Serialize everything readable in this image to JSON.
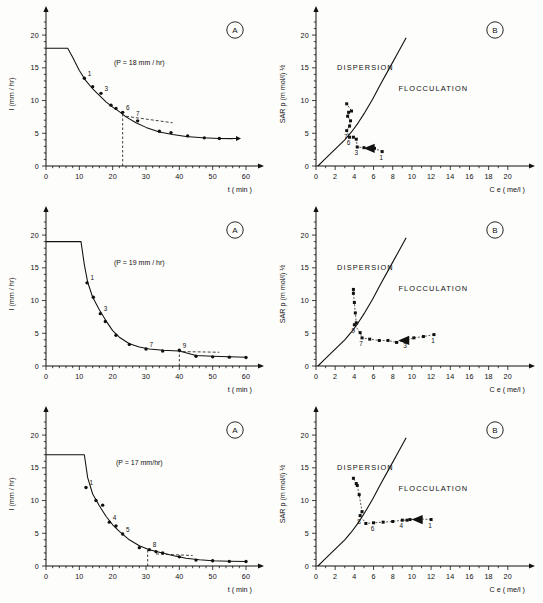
{
  "figure": {
    "panel_badge_a": "A",
    "panel_badge_b": "B",
    "caption": ""
  },
  "axes": {
    "left_ylabel": "I  (mm / hr)",
    "left_xlabel": "t ( min )",
    "right_ylabel": "SAR p  (m mol/l) ½",
    "right_xlabel": "C e ( me/l )",
    "left_yticks": [
      "0",
      "5",
      "10",
      "15",
      "20"
    ],
    "left_xticks": [
      "0",
      "10",
      "20",
      "30",
      "40",
      "50",
      "60"
    ],
    "right_yticks": [
      "0",
      "5",
      "10",
      "15",
      "20"
    ],
    "right_xticks": [
      "0",
      "2",
      "4",
      "6",
      "8",
      "10",
      "12",
      "14",
      "16",
      "18",
      "20"
    ]
  },
  "regions": {
    "dispersion": "DISPERSION",
    "flocculation": "FLOCCULATION"
  },
  "chart_data": [
    {
      "id": "row1-A",
      "type": "line",
      "title": "(P = 18 mm / hr)",
      "xlabel": "t ( min )",
      "ylabel": "I  (mm / hr)",
      "xlim": [
        0,
        63
      ],
      "ylim": [
        0,
        22
      ],
      "xticks": [
        0,
        10,
        20,
        30,
        40,
        50,
        60
      ],
      "yticks": [
        0,
        5,
        10,
        15,
        20
      ],
      "grid": false,
      "plateau": {
        "y": 18.0,
        "x_start": 0,
        "x_end": 6.5
      },
      "curve": [
        [
          6.5,
          18.0
        ],
        [
          8,
          16.6
        ],
        [
          10,
          14.6
        ],
        [
          12,
          13.0
        ],
        [
          14,
          11.8
        ],
        [
          16,
          10.8
        ],
        [
          18,
          9.8
        ],
        [
          20,
          9.0
        ],
        [
          22,
          8.3
        ],
        [
          24,
          7.5
        ],
        [
          27,
          6.6
        ],
        [
          30,
          5.9
        ],
        [
          34,
          5.2
        ],
        [
          38,
          4.8
        ],
        [
          42,
          4.5
        ],
        [
          47,
          4.3
        ],
        [
          52,
          4.2
        ],
        [
          56,
          4.15
        ]
      ],
      "points": [
        {
          "x": 11.5,
          "y": 13.4,
          "label": "1"
        },
        {
          "x": 14.0,
          "y": 12.1,
          "label": ""
        },
        {
          "x": 16.5,
          "y": 11.1,
          "label": "3"
        },
        {
          "x": 19.5,
          "y": 9.3,
          "label": ""
        },
        {
          "x": 21.0,
          "y": 8.8,
          "label": ""
        },
        {
          "x": 23.0,
          "y": 8.2,
          "label": "6"
        },
        {
          "x": 27.5,
          "y": 6.9,
          "label": ""
        },
        {
          "x": 34.0,
          "y": 5.3,
          "label": ""
        },
        {
          "x": 37.5,
          "y": 5.1,
          "label": ""
        },
        {
          "x": 42.5,
          "y": 4.6,
          "label": ""
        },
        {
          "x": 47.5,
          "y": 4.3,
          "label": ""
        },
        {
          "x": 52.0,
          "y": 4.2,
          "label": ""
        }
      ],
      "marker_label_7": {
        "x": 27.0,
        "y": 7.6,
        "label": "7"
      },
      "dashed_vertical_x": 23.0,
      "dashed_tangent": [
        [
          24.0,
          7.6
        ],
        [
          38.0,
          6.6
        ]
      ],
      "end_arrow": {
        "x0": 52,
        "y0": 4.2,
        "x1": 57,
        "y1": 4.2
      }
    },
    {
      "id": "row1-B",
      "type": "scatter",
      "xlabel": "C e ( me/l )",
      "ylabel": "SAR p  (m mol/l) ½",
      "xlim": [
        0,
        22
      ],
      "ylim": [
        0,
        22
      ],
      "xticks": [
        0,
        2,
        4,
        6,
        8,
        10,
        12,
        14,
        16,
        18,
        20
      ],
      "yticks": [
        0,
        5,
        10,
        15,
        20
      ],
      "grid": false,
      "threshold_curve": [
        [
          0.2,
          0.0
        ],
        [
          0.9,
          1.0
        ],
        [
          1.6,
          2.0
        ],
        [
          2.3,
          3.0
        ],
        [
          3.0,
          4.0
        ],
        [
          3.7,
          5.2
        ],
        [
          4.4,
          6.6
        ],
        [
          5.1,
          8.2
        ],
        [
          5.9,
          10.2
        ],
        [
          6.7,
          12.4
        ],
        [
          7.6,
          14.8
        ],
        [
          8.5,
          17.2
        ],
        [
          9.4,
          19.6
        ]
      ],
      "path_points": [
        {
          "x": 6.9,
          "y": 2.2,
          "label": "1"
        },
        {
          "x": 6.1,
          "y": 2.7,
          "label": ""
        },
        {
          "x": 5.6,
          "y": 2.7,
          "label": ""
        },
        {
          "x": 5.0,
          "y": 2.8,
          "label": ""
        },
        {
          "x": 4.3,
          "y": 2.9,
          "label": "3"
        },
        {
          "x": 4.2,
          "y": 4.1,
          "label": ""
        },
        {
          "x": 3.9,
          "y": 4.4,
          "label": ""
        },
        {
          "x": 3.5,
          "y": 4.4,
          "label": "6"
        },
        {
          "x": 3.2,
          "y": 5.4,
          "label": "7"
        },
        {
          "x": 3.5,
          "y": 6.1,
          "label": ""
        },
        {
          "x": 3.6,
          "y": 6.9,
          "label": ""
        },
        {
          "x": 3.3,
          "y": 7.6,
          "label": ""
        },
        {
          "x": 3.4,
          "y": 8.2,
          "label": ""
        },
        {
          "x": 3.7,
          "y": 8.4,
          "label": ""
        },
        {
          "x": 3.2,
          "y": 9.5,
          "label": ""
        }
      ],
      "arrow_marker": {
        "x": 5.6,
        "y": 2.7,
        "dir": "left"
      }
    },
    {
      "id": "row2-A",
      "type": "line",
      "title": "(P = 19 mm / hr)",
      "xlabel": "t ( min )",
      "ylabel": "I  (mm / hr)",
      "xlim": [
        0,
        63
      ],
      "ylim": [
        0,
        22
      ],
      "xticks": [
        0,
        10,
        20,
        30,
        40,
        50,
        60
      ],
      "yticks": [
        0,
        5,
        10,
        15,
        20
      ],
      "grid": false,
      "plateau": {
        "y": 19.0,
        "x_start": 0,
        "x_end": 10.5
      },
      "curve": [
        [
          10.5,
          19.0
        ],
        [
          11.5,
          15.5
        ],
        [
          12.5,
          12.8
        ],
        [
          14,
          10.5
        ],
        [
          16,
          8.6
        ],
        [
          18,
          6.9
        ],
        [
          20,
          5.4
        ],
        [
          22,
          4.4
        ],
        [
          25,
          3.4
        ],
        [
          28,
          2.9
        ],
        [
          31,
          2.6
        ],
        [
          35,
          2.4
        ],
        [
          40,
          2.3
        ],
        [
          45,
          1.6
        ],
        [
          50,
          1.5
        ],
        [
          55,
          1.4
        ],
        [
          60,
          1.35
        ]
      ],
      "points": [
        {
          "x": 12.3,
          "y": 12.7,
          "label": "1"
        },
        {
          "x": 14.2,
          "y": 10.5,
          "label": ""
        },
        {
          "x": 16.3,
          "y": 8.0,
          "label": "3"
        },
        {
          "x": 17.8,
          "y": 6.8,
          "label": ""
        },
        {
          "x": 21.0,
          "y": 4.7,
          "label": ""
        },
        {
          "x": 25.0,
          "y": 3.3,
          "label": ""
        },
        {
          "x": 30.0,
          "y": 2.6,
          "label": "7"
        },
        {
          "x": 35.0,
          "y": 2.3,
          "label": ""
        },
        {
          "x": 40.0,
          "y": 2.4,
          "label": "9"
        },
        {
          "x": 45.0,
          "y": 1.5,
          "label": ""
        },
        {
          "x": 50.0,
          "y": 1.4,
          "label": ""
        },
        {
          "x": 55.0,
          "y": 1.35,
          "label": ""
        },
        {
          "x": 60.0,
          "y": 1.3,
          "label": ""
        }
      ],
      "dashed_vertical_x": 40.0,
      "dashed_tangent": [
        [
          41.0,
          2.2
        ],
        [
          52.0,
          2.1
        ]
      ]
    },
    {
      "id": "row2-B",
      "type": "scatter",
      "xlabel": "C e ( me/l )",
      "ylabel": "SAR p  (m mol/l) ½",
      "xlim": [
        0,
        22
      ],
      "ylim": [
        0,
        22
      ],
      "xticks": [
        0,
        2,
        4,
        6,
        8,
        10,
        12,
        14,
        16,
        18,
        20
      ],
      "yticks": [
        0,
        5,
        10,
        15,
        20
      ],
      "grid": false,
      "threshold_curve": [
        [
          0.2,
          0.0
        ],
        [
          0.9,
          1.0
        ],
        [
          1.6,
          2.0
        ],
        [
          2.3,
          3.0
        ],
        [
          3.0,
          4.0
        ],
        [
          3.7,
          5.2
        ],
        [
          4.4,
          6.6
        ],
        [
          5.1,
          8.2
        ],
        [
          5.9,
          10.2
        ],
        [
          6.7,
          12.4
        ],
        [
          7.6,
          14.8
        ],
        [
          8.5,
          17.2
        ],
        [
          9.4,
          19.6
        ]
      ],
      "path_points": [
        {
          "x": 12.3,
          "y": 4.8,
          "label": "1"
        },
        {
          "x": 11.2,
          "y": 4.5,
          "label": ""
        },
        {
          "x": 10.2,
          "y": 4.3,
          "label": ""
        },
        {
          "x": 9.4,
          "y": 3.9,
          "label": "3"
        },
        {
          "x": 8.4,
          "y": 3.6,
          "label": ""
        },
        {
          "x": 7.5,
          "y": 3.9,
          "label": ""
        },
        {
          "x": 6.6,
          "y": 3.9,
          "label": ""
        },
        {
          "x": 5.6,
          "y": 4.1,
          "label": ""
        },
        {
          "x": 4.8,
          "y": 4.3,
          "label": "7"
        },
        {
          "x": 4.6,
          "y": 5.1,
          "label": ""
        },
        {
          "x": 4.0,
          "y": 6.3,
          "label": "9"
        },
        {
          "x": 4.2,
          "y": 6.6,
          "label": ""
        },
        {
          "x": 4.1,
          "y": 8.1,
          "label": ""
        },
        {
          "x": 4.0,
          "y": 9.7,
          "label": ""
        },
        {
          "x": 3.9,
          "y": 11.1,
          "label": ""
        },
        {
          "x": 3.9,
          "y": 11.7,
          "label": ""
        }
      ],
      "arrow_marker": {
        "x": 9.2,
        "y": 3.9,
        "dir": "left"
      }
    },
    {
      "id": "row3-A",
      "type": "line",
      "title": "(P = 17 mm/hr)",
      "xlabel": "t ( min )",
      "ylabel": "I  (mm / hr)",
      "xlim": [
        0,
        63
      ],
      "ylim": [
        0,
        22
      ],
      "xticks": [
        0,
        10,
        20,
        30,
        40,
        50,
        60
      ],
      "yticks": [
        0,
        5,
        10,
        15,
        20
      ],
      "grid": false,
      "plateau": {
        "y": 17.0,
        "x_start": 0,
        "x_end": 11.5
      },
      "curve": [
        [
          11.5,
          17.0
        ],
        [
          12.5,
          13.5
        ],
        [
          14,
          11.0
        ],
        [
          16,
          9.2
        ],
        [
          18,
          7.6
        ],
        [
          20,
          6.3
        ],
        [
          22,
          5.3
        ],
        [
          25,
          4.0
        ],
        [
          28,
          3.1
        ],
        [
          31,
          2.5
        ],
        [
          34,
          2.1
        ],
        [
          38,
          1.6
        ],
        [
          42,
          1.2
        ],
        [
          46,
          0.95
        ],
        [
          50,
          0.8
        ],
        [
          55,
          0.72
        ],
        [
          60,
          0.68
        ]
      ],
      "points": [
        {
          "x": 12.0,
          "y": 12.0,
          "label": "1"
        },
        {
          "x": 15.0,
          "y": 10.0,
          "label": ""
        },
        {
          "x": 17.0,
          "y": 9.3,
          "label": ""
        },
        {
          "x": 19.0,
          "y": 6.7,
          "label": "4"
        },
        {
          "x": 21.0,
          "y": 6.1,
          "label": ""
        },
        {
          "x": 23.0,
          "y": 4.9,
          "label": "5"
        },
        {
          "x": 28.0,
          "y": 2.8,
          "label": ""
        },
        {
          "x": 31.0,
          "y": 2.5,
          "label": "8"
        },
        {
          "x": 33.0,
          "y": 2.2,
          "label": ""
        },
        {
          "x": 35.0,
          "y": 2.0,
          "label": ""
        },
        {
          "x": 40.0,
          "y": 1.4,
          "label": ""
        },
        {
          "x": 45.0,
          "y": 0.9,
          "label": ""
        },
        {
          "x": 50.0,
          "y": 0.8,
          "label": ""
        },
        {
          "x": 55.0,
          "y": 0.7,
          "label": ""
        },
        {
          "x": 60.0,
          "y": 0.68,
          "label": ""
        }
      ],
      "dashed_vertical_x": 30.5,
      "dashed_tangent": [
        [
          33.0,
          1.85
        ],
        [
          44.0,
          1.6
        ]
      ]
    },
    {
      "id": "row3-B",
      "type": "scatter",
      "xlabel": "C e ( me/l )",
      "ylabel": "SAR p  (m mol/l) ½",
      "xlim": [
        0,
        22
      ],
      "ylim": [
        0,
        22
      ],
      "xticks": [
        0,
        2,
        4,
        6,
        8,
        10,
        12,
        14,
        16,
        18,
        20
      ],
      "yticks": [
        0,
        5,
        10,
        15,
        20
      ],
      "grid": false,
      "threshold_curve": [
        [
          0.2,
          0.0
        ],
        [
          0.9,
          1.0
        ],
        [
          1.6,
          2.0
        ],
        [
          2.3,
          3.0
        ],
        [
          3.0,
          4.0
        ],
        [
          3.7,
          5.2
        ],
        [
          4.4,
          6.6
        ],
        [
          5.1,
          8.2
        ],
        [
          5.9,
          10.2
        ],
        [
          6.7,
          12.4
        ],
        [
          7.6,
          14.8
        ],
        [
          8.5,
          17.2
        ],
        [
          9.4,
          19.6
        ]
      ],
      "path_points": [
        {
          "x": 12.0,
          "y": 7.1,
          "label": "1"
        },
        {
          "x": 10.8,
          "y": 7.2,
          "label": ""
        },
        {
          "x": 9.8,
          "y": 7.1,
          "label": ""
        },
        {
          "x": 9.5,
          "y": 7.0,
          "label": ""
        },
        {
          "x": 9.0,
          "y": 7.0,
          "label": "4"
        },
        {
          "x": 8.0,
          "y": 6.8,
          "label": ""
        },
        {
          "x": 7.0,
          "y": 6.7,
          "label": ""
        },
        {
          "x": 6.0,
          "y": 6.6,
          "label": "6"
        },
        {
          "x": 5.2,
          "y": 6.5,
          "label": ""
        },
        {
          "x": 4.6,
          "y": 7.7,
          "label": "8"
        },
        {
          "x": 4.8,
          "y": 8.3,
          "label": ""
        },
        {
          "x": 4.5,
          "y": 10.9,
          "label": ""
        },
        {
          "x": 4.3,
          "y": 12.3,
          "label": ""
        },
        {
          "x": 4.2,
          "y": 12.6,
          "label": ""
        },
        {
          "x": 3.9,
          "y": 13.4,
          "label": ""
        }
      ],
      "arrow_marker": {
        "x": 10.6,
        "y": 7.1,
        "dir": "left"
      }
    }
  ]
}
